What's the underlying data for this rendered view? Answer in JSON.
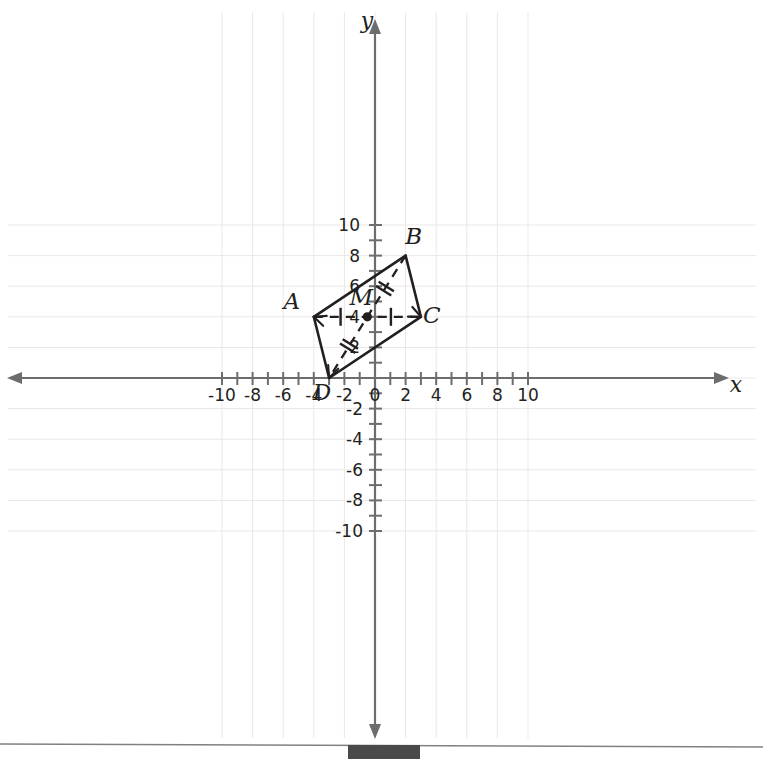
{
  "chart_data": {
    "type": "scatter",
    "title": "",
    "xlabel": "x",
    "ylabel": "y",
    "xlim": [
      -11.2,
      11.2
    ],
    "ylim": [
      -11.2,
      11.2
    ],
    "grid": true,
    "grid_step": 2,
    "tick_step": 1,
    "x_tick_labels": [
      "-10",
      "-8",
      "-6",
      "-4",
      "-2",
      "0",
      "2",
      "4",
      "6",
      "8",
      "10"
    ],
    "x_tick_values": [
      -10,
      -8,
      -6,
      -4,
      -2,
      0,
      2,
      4,
      6,
      8,
      10
    ],
    "y_tick_labels": [
      "10",
      "8",
      "6",
      "4",
      "2",
      "-2",
      "-4",
      "-6",
      "-8",
      "-10"
    ],
    "y_tick_values": [
      10,
      8,
      6,
      4,
      2,
      -2,
      -4,
      -6,
      -8,
      -10
    ],
    "y_label_hidden_by_point": "4",
    "shape": "parallelogram",
    "points": [
      {
        "label": "A",
        "x": -4,
        "y": 4,
        "label_dx": -22,
        "label_dy": -8
      },
      {
        "label": "B",
        "x": 2,
        "y": 8,
        "label_dx": 8,
        "label_dy": -12
      },
      {
        "label": "C",
        "x": 3,
        "y": 4,
        "label_dx": 11,
        "label_dy": 6
      },
      {
        "label": "D",
        "x": -3,
        "y": 0,
        "label_dx": -7,
        "label_dy": 22
      },
      {
        "label": "M",
        "x": -0.5,
        "y": 4,
        "label_dx": -6,
        "label_dy": -12
      }
    ],
    "sides": [
      {
        "from": "A",
        "to": "B",
        "style": "solid"
      },
      {
        "from": "B",
        "to": "C",
        "style": "solid"
      },
      {
        "from": "C",
        "to": "D",
        "style": "solid"
      },
      {
        "from": "D",
        "to": "A",
        "style": "solid"
      }
    ],
    "diagonals": [
      {
        "from": "A",
        "to": "C",
        "style": "dashed",
        "ticks": 1,
        "tick_orientation": "perpendicular"
      },
      {
        "from": "B",
        "to": "D",
        "style": "dashed",
        "ticks": 2,
        "tick_orientation": "perpendicular"
      }
    ],
    "congruence_marks": [
      {
        "segment": "AM",
        "count": 1
      },
      {
        "segment": "MC",
        "count": 1
      },
      {
        "segment": "MB",
        "count": 2
      },
      {
        "segment": "MD",
        "count": 2
      }
    ],
    "annotations": [
      {
        "text": "M",
        "meaning": "midpoint of both diagonals"
      }
    ]
  },
  "figure": {
    "axis_x_name": "x",
    "axis_y_name": "y",
    "vertex_a": "A",
    "vertex_b": "B",
    "vertex_c": "C",
    "vertex_d": "D",
    "midpoint_m": "M"
  },
  "footer": {
    "has_rule": true,
    "has_block": true
  }
}
